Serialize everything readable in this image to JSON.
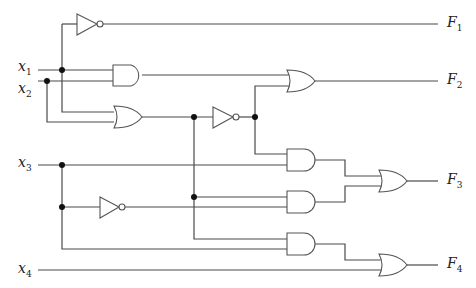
{
  "diagram": {
    "type": "combinational logic circuit",
    "inputs": [
      {
        "name": "x",
        "sub": "1"
      },
      {
        "name": "x",
        "sub": "2"
      },
      {
        "name": "x",
        "sub": "3"
      },
      {
        "name": "x",
        "sub": "4"
      }
    ],
    "outputs": [
      {
        "name": "F",
        "sub": "1"
      },
      {
        "name": "F",
        "sub": "2"
      },
      {
        "name": "F",
        "sub": "3"
      },
      {
        "name": "F",
        "sub": "4"
      }
    ],
    "gates": [
      {
        "id": "not1",
        "type": "NOT",
        "inputs": [
          "x1"
        ],
        "output": "F1"
      },
      {
        "id": "and1",
        "type": "AND",
        "inputs": [
          "x1",
          "x2"
        ]
      },
      {
        "id": "or1",
        "type": "OR",
        "inputs": [
          "x1",
          "x2"
        ]
      },
      {
        "id": "not2",
        "type": "NOT",
        "inputs": [
          "or1"
        ]
      },
      {
        "id": "or2",
        "type": "OR",
        "inputs": [
          "and1",
          "not2"
        ],
        "output": "F2"
      },
      {
        "id": "and2",
        "type": "AND",
        "inputs": [
          "not2",
          "x3"
        ]
      },
      {
        "id": "not3",
        "type": "NOT",
        "inputs": [
          "x3"
        ]
      },
      {
        "id": "and3",
        "type": "AND",
        "inputs": [
          "or1",
          "not3"
        ]
      },
      {
        "id": "and4",
        "type": "AND",
        "inputs": [
          "or1",
          "x3"
        ]
      },
      {
        "id": "or3",
        "type": "OR",
        "inputs": [
          "and2",
          "and3"
        ],
        "output": "F3"
      },
      {
        "id": "or4",
        "type": "OR",
        "inputs": [
          "and4",
          "x4"
        ],
        "output": "F4"
      }
    ],
    "colors": {
      "wire": "#4a4a4a",
      "junction": "#111111",
      "background": "#ffffff"
    }
  }
}
